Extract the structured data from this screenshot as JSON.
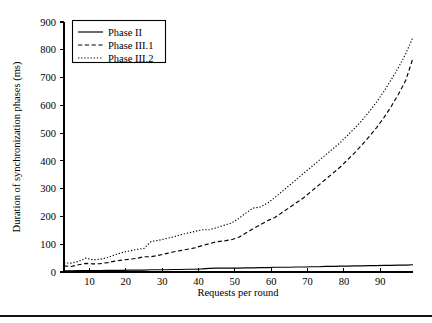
{
  "figure": {
    "background_color": "#ffffff",
    "line_color": "#000000"
  },
  "bottom_rule": {
    "present": true,
    "label": "bottom-divider-rule"
  },
  "chart_data": {
    "type": "line",
    "title": "",
    "subtitle": "",
    "xlabel": "Requests per round",
    "ylabel": "Duration of synchronization phases (ms)",
    "xlim": [
      3,
      99
    ],
    "ylim": [
      0,
      900
    ],
    "xticks": [
      10,
      20,
      30,
      40,
      50,
      60,
      70,
      80,
      90
    ],
    "xticklabels": [
      "10",
      "20",
      "30",
      "40",
      "50",
      "60",
      "70",
      "80",
      "90"
    ],
    "yticks": [
      0,
      100,
      200,
      300,
      400,
      500,
      600,
      700,
      800,
      900
    ],
    "yticklabels": [
      "0",
      "100",
      "200",
      "300",
      "400",
      "500",
      "600",
      "700",
      "800",
      "900"
    ],
    "grid": false,
    "legend_position": "upper left",
    "legend_entries": [
      "Phase II",
      "Phase III.1",
      "Phase III.2"
    ],
    "x": [
      3,
      5,
      7,
      9,
      11,
      13,
      15,
      17,
      19,
      21,
      23,
      25,
      27,
      29,
      31,
      33,
      35,
      37,
      39,
      41,
      43,
      45,
      47,
      49,
      51,
      53,
      55,
      57,
      59,
      61,
      63,
      65,
      67,
      69,
      71,
      73,
      75,
      77,
      79,
      81,
      83,
      85,
      87,
      89,
      91,
      93,
      95,
      97,
      99
    ],
    "series": [
      {
        "name": "Phase II",
        "style": "solid",
        "values": [
          4,
          4,
          5,
          5,
          5,
          5,
          6,
          6,
          6,
          7,
          7,
          7,
          8,
          8,
          8,
          9,
          9,
          10,
          10,
          11,
          13,
          14,
          14,
          14,
          14,
          15,
          15,
          16,
          16,
          17,
          17,
          17,
          18,
          18,
          19,
          19,
          20,
          20,
          21,
          21,
          22,
          22,
          23,
          23,
          24,
          24,
          25,
          25,
          26
        ]
      },
      {
        "name": "Phase III.1",
        "style": "dashed",
        "values": [
          22,
          20,
          26,
          31,
          29,
          30,
          34,
          39,
          43,
          46,
          49,
          55,
          55,
          60,
          66,
          72,
          77,
          82,
          87,
          95,
          102,
          109,
          112,
          116,
          124,
          140,
          156,
          170,
          185,
          196,
          214,
          232,
          250,
          268,
          290,
          312,
          334,
          356,
          378,
          404,
          430,
          458,
          488,
          520,
          556,
          596,
          640,
          690,
          770
        ]
      },
      {
        "name": "Phase III.2",
        "style": "dotted",
        "values": [
          33,
          32,
          38,
          50,
          44,
          46,
          52,
          62,
          70,
          76,
          81,
          85,
          110,
          114,
          120,
          126,
          134,
          140,
          146,
          152,
          152,
          160,
          168,
          176,
          192,
          212,
          230,
          234,
          248,
          268,
          290,
          312,
          334,
          356,
          378,
          400,
          422,
          444,
          466,
          492,
          518,
          546,
          578,
          612,
          650,
          692,
          736,
          786,
          845
        ]
      }
    ]
  }
}
